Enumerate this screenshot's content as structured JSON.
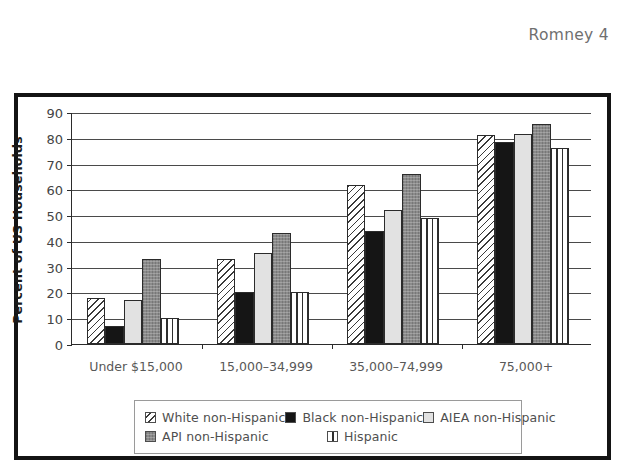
{
  "page": {
    "running_header": "Romney 4"
  },
  "chart_data": {
    "type": "bar",
    "title": "",
    "xlabel": "",
    "ylabel": "Percent of US Households",
    "ylim": [
      0,
      90
    ],
    "ytick_step": 10,
    "yticks": [
      "90",
      "80",
      "70",
      "60",
      "50",
      "40",
      "30",
      "20",
      "10",
      "0"
    ],
    "grid": true,
    "legend_position": "bottom",
    "categories": [
      "Under $15,000",
      "15,000–34,999",
      "35,000–74,999",
      "75,000+"
    ],
    "series": [
      {
        "name": "White non-Hispanic",
        "pattern": "diagonal-hatch",
        "color": "#ffffff",
        "values": [
          18,
          33,
          61.5,
          81
        ]
      },
      {
        "name": "Black non-Hispanic",
        "pattern": "solid-black",
        "color": "#151515",
        "values": [
          7,
          20,
          44,
          78.5
        ]
      },
      {
        "name": "AIEA non-Hispanic",
        "pattern": "light-gray",
        "color": "#e2e2e2",
        "values": [
          17,
          35.5,
          52,
          81.5
        ]
      },
      {
        "name": "API non-Hispanic",
        "pattern": "dark-gray",
        "color": "#8b8b8b",
        "values": [
          33,
          43,
          66,
          85.5
        ]
      },
      {
        "name": "Hispanic",
        "pattern": "vertical-stripes",
        "color": "#ffffff",
        "values": [
          10,
          20,
          49,
          76
        ]
      }
    ]
  }
}
